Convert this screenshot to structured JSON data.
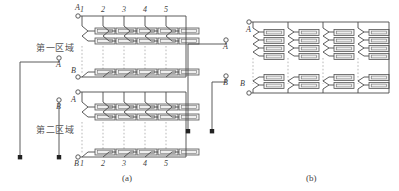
{
  "figure": {
    "panels": [
      {
        "id": "a",
        "caption": "(a)",
        "column_numbers_top": [
          "1",
          "2",
          "3",
          "4",
          "5"
        ],
        "column_numbers_bottom": [
          "1",
          "2",
          "3",
          "4",
          "5"
        ],
        "regions": [
          {
            "label": "第一区域",
            "terminal_in": "A",
            "terminal_out": "B"
          },
          {
            "label": "第二区域",
            "terminal_in": "A",
            "terminal_out": "B"
          }
        ],
        "external_terminals": [
          {
            "label": "A",
            "type": "open-circle"
          },
          {
            "label": "B",
            "type": "open-circle"
          }
        ],
        "ground_nodes": 2,
        "rows_per_column_top": 2,
        "rows_per_column_bottom": 1,
        "element_type": "resistor-box"
      },
      {
        "id": "b",
        "caption": "(b)",
        "terminals_on_bus": [
          {
            "label": "A",
            "type": "open-circle"
          },
          {
            "label": "B",
            "type": "open-circle"
          }
        ],
        "external_terminals": [
          {
            "label": "A",
            "type": "open-circle"
          },
          {
            "label": "B",
            "type": "open-circle"
          }
        ],
        "ground_nodes": 2,
        "columns": 4,
        "rows_per_column_top": 4,
        "rows_per_column_bottom": 2,
        "element_type": "resistor-box"
      }
    ]
  },
  "colors": {
    "wire": "#4a4a4a",
    "dashed": "#9a9a9a",
    "box_fill": "#efefef",
    "box_stroke": "#555555",
    "text": "#3a3a3a"
  }
}
